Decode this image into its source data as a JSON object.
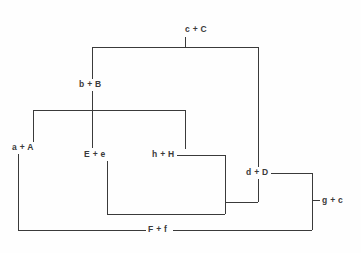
{
  "diagram": {
    "title": "",
    "background_color": "#fefefe",
    "line_color": "#3a3a3a",
    "text_color": "#3a3a3a",
    "line_width": 1,
    "nodes": [
      {
        "id": "cC",
        "label": "c + C",
        "x": 185,
        "y": 25
      },
      {
        "id": "bB",
        "label": "b + B",
        "x": 79,
        "y": 80
      },
      {
        "id": "aA",
        "label": "a + A",
        "x": 12,
        "y": 143
      },
      {
        "id": "Ee",
        "label": "E + e",
        "x": 84,
        "y": 150
      },
      {
        "id": "hH",
        "label": "h + H",
        "x": 152,
        "y": 150
      },
      {
        "id": "dD",
        "label": "d + D",
        "x": 246,
        "y": 168
      },
      {
        "id": "gc",
        "label": "g + c",
        "x": 320,
        "y": 195
      },
      {
        "id": "Ff",
        "label": "F + f",
        "x": 147,
        "y": 225
      }
    ],
    "edges": [
      {
        "id": "cC-tick",
        "from": "c + C",
        "to": "top-bus",
        "points": "185,37 185,47"
      },
      {
        "id": "top-bus",
        "from": "b + B",
        "to": "d + D",
        "points": "92,47 258,47"
      },
      {
        "id": "bB-riser",
        "from": "top-bus",
        "to": "b + B",
        "points": "92,47 92,79"
      },
      {
        "id": "dD-riser",
        "from": "top-bus",
        "to": "d + D",
        "points": "258,47 258,167"
      },
      {
        "id": "bB-drop",
        "from": "b + B",
        "to": "E + e",
        "points": "92,91 92,148"
      },
      {
        "id": "mid-bus",
        "from": "a + A",
        "to": "h + H",
        "points": "33,110 185,110"
      },
      {
        "id": "aA-riser",
        "from": "mid-bus",
        "to": "a + A",
        "points": "33,110 33,142"
      },
      {
        "id": "hH-riser",
        "from": "mid-bus",
        "to": "h + H",
        "points": "185,110 185,149"
      },
      {
        "id": "aA-drop",
        "from": "a + A",
        "to": "F + f",
        "points": "18,154 18,230"
      },
      {
        "id": "Ee-drop",
        "from": "E + e",
        "to": "lower-bus",
        "points": "107,161 107,214"
      },
      {
        "id": "lower-bus",
        "from": "E + e",
        "to": "h + H",
        "points": "107,214 225,214"
      },
      {
        "id": "hH-out",
        "from": "h + H",
        "to": "d + D",
        "points": "177,155 225,155"
      },
      {
        "id": "hH-down",
        "from": "h + H",
        "to": "lower-bus",
        "points": "225,155 225,214"
      },
      {
        "id": "dD-join",
        "from": "h + H",
        "to": "d + D",
        "points": "225,202 258,202"
      },
      {
        "id": "dD-drop",
        "from": "d + D",
        "to": "dD-join",
        "points": "258,179 258,202"
      },
      {
        "id": "dD-out",
        "from": "d + D",
        "to": "g + c",
        "points": "271,173 312,173"
      },
      {
        "id": "gc-spine",
        "from": "d + D",
        "to": "F + f",
        "points": "312,173 312,230"
      },
      {
        "id": "gc-tick",
        "from": "gc-spine",
        "to": "g + c",
        "points": "312,200 320,200"
      },
      {
        "id": "bottom-left",
        "from": "a + A",
        "to": "F + f",
        "points": "18,230 147,230"
      },
      {
        "id": "bottom-right",
        "from": "F + f",
        "to": "g + c",
        "points": "173,230 312,230"
      }
    ]
  }
}
